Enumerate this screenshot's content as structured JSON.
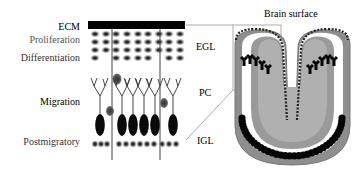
{
  "labels": {
    "stages": [
      {
        "id": "ecm",
        "text": "ECM",
        "color": "#111111"
      },
      {
        "id": "proliferation",
        "text": "Proliferation",
        "color": "#555555"
      },
      {
        "id": "differentiation",
        "text": "Differentiation",
        "color": "#333333"
      },
      {
        "id": "migration",
        "text": "Migration",
        "color": "#111111"
      },
      {
        "id": "postmigratory",
        "text": "Postmigratory",
        "color": "#333333"
      }
    ],
    "layers": [
      {
        "id": "egl",
        "text": "EGL"
      },
      {
        "id": "pc",
        "text": "PC"
      },
      {
        "id": "igl",
        "text": "IGL"
      }
    ],
    "brain_surface": "Brain surface"
  },
  "colors": {
    "ecm_bar": "#000000",
    "granule_cell": "#7a7a7a",
    "granule_nucleus": "#222222",
    "purkinje_cell": "#0a0a0a",
    "migrating_cell": "#555555",
    "fiber": "#333333",
    "pia_chain": "#222222",
    "egl_band": "#9a9a9a",
    "inner_band": "#8c8c8c",
    "connector_line": "#666666"
  }
}
